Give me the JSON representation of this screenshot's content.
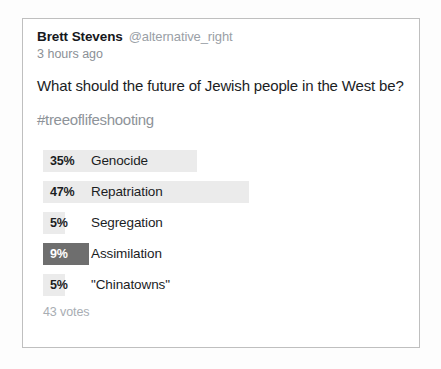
{
  "tweet": {
    "author_name": "Brett Stevens",
    "author_handle": "@alternative_right",
    "timestamp": "3 hours ago",
    "question": "What should the future of Jewish people in the West be?",
    "hashtag": "#treeoflifeshooting"
  },
  "poll": {
    "votes_label": "43 votes",
    "bar_color": "#ebebeb",
    "selected_bar_color": "#6e6e6e",
    "options": [
      {
        "percent": "35%",
        "value": 35,
        "label": "Genocide",
        "selected": false,
        "bar_width": 154
      },
      {
        "percent": "47%",
        "value": 47,
        "label": "Repatriation",
        "selected": false,
        "bar_width": 206
      },
      {
        "percent": "5%",
        "value": 5,
        "label": "Segregation",
        "selected": false,
        "bar_width": 22
      },
      {
        "percent": "9%",
        "value": 9,
        "label": "Assimilation",
        "selected": true,
        "bar_width": 46
      },
      {
        "percent": "5%",
        "value": 5,
        "label": "\"Chinatowns\"",
        "selected": false,
        "bar_width": 22
      }
    ]
  },
  "chart_data": {
    "type": "bar",
    "title": "What should the future of Jewish people in the West be?",
    "categories": [
      "Genocide",
      "Repatriation",
      "Segregation",
      "Assimilation",
      "\"Chinatowns\""
    ],
    "values": [
      35,
      47,
      5,
      9,
      5
    ],
    "xlabel": "",
    "ylabel": "Share of votes (%)",
    "ylim": [
      0,
      100
    ],
    "total_votes": 43,
    "highlighted_category": "Assimilation",
    "legend": "none",
    "grid": false
  }
}
